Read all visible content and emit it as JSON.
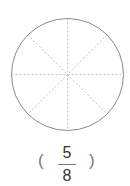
{
  "figure": {
    "shape": "circle",
    "divisions": 8,
    "divider_style": "dashed",
    "outline_color": "#8a8a8a",
    "divider_color": "#b5b5b5"
  },
  "answer": {
    "open_paren": "(",
    "numerator": "5",
    "denominator": "8",
    "close_paren": ")"
  }
}
